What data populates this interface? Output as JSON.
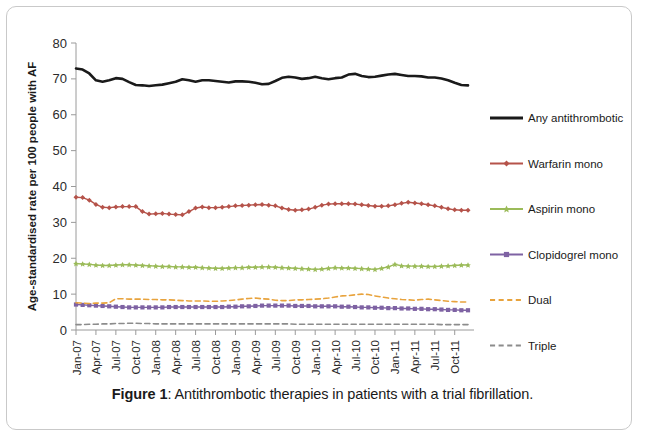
{
  "figure": {
    "caption_prefix": "Figure 1",
    "caption_text": ": Antithrombotic therapies in patients with a trial fibrillation."
  },
  "chart_data": {
    "type": "line",
    "title": "",
    "xlabel": "",
    "ylabel": "Age-standardised rate per 100 people with AF",
    "ylim": [
      0,
      80
    ],
    "ytick_labels": [
      "0",
      "10",
      "20",
      "30",
      "40",
      "50",
      "60",
      "70",
      "80"
    ],
    "yticks": [
      0,
      10,
      20,
      30,
      40,
      50,
      60,
      70,
      80
    ],
    "grid": false,
    "legend_position": "right",
    "x_start": "Jan-07",
    "x_end": "Dec-11",
    "tick_labels": [
      "Jan-07",
      "Apr-07",
      "Jul-07",
      "Oct-07",
      "Jan-08",
      "Apr-08",
      "Jul-08",
      "Oct-08",
      "Jan-09",
      "Apr-09",
      "Jul-09",
      "Oct-09",
      "Jan-10",
      "Apr-10",
      "Jul-10",
      "Oct-10",
      "Jan-11",
      "Apr-11",
      "Jul-11",
      "Oct-11"
    ],
    "x": [
      "Jan-07",
      "Feb-07",
      "Mar-07",
      "Apr-07",
      "May-07",
      "Jun-07",
      "Jul-07",
      "Aug-07",
      "Sep-07",
      "Oct-07",
      "Nov-07",
      "Dec-07",
      "Jan-08",
      "Feb-08",
      "Mar-08",
      "Apr-08",
      "May-08",
      "Jun-08",
      "Jul-08",
      "Aug-08",
      "Sep-08",
      "Oct-08",
      "Nov-08",
      "Dec-08",
      "Jan-09",
      "Feb-09",
      "Mar-09",
      "Apr-09",
      "May-09",
      "Jun-09",
      "Jul-09",
      "Aug-09",
      "Sep-09",
      "Oct-09",
      "Nov-09",
      "Dec-09",
      "Jan-10",
      "Feb-10",
      "Mar-10",
      "Apr-10",
      "May-10",
      "Jun-10",
      "Jul-10",
      "Aug-10",
      "Sep-10",
      "Oct-10",
      "Nov-10",
      "Dec-10",
      "Jan-11",
      "Feb-11",
      "Mar-11",
      "Apr-11",
      "May-11",
      "Jun-11",
      "Jul-11",
      "Aug-11",
      "Sep-11",
      "Oct-11",
      "Nov-11",
      "Dec-11"
    ],
    "series": [
      {
        "name": "Any antithrombotic",
        "color": "#1a1a1a",
        "style": "solid",
        "marker": "none",
        "width": 2.6,
        "values": [
          72.9,
          72.6,
          71.5,
          69.6,
          69.2,
          69.6,
          70.2,
          70.0,
          69.1,
          68.3,
          68.2,
          68.0,
          68.2,
          68.4,
          68.8,
          69.2,
          69.9,
          69.6,
          69.2,
          69.6,
          69.6,
          69.4,
          69.2,
          69.0,
          69.3,
          69.3,
          69.2,
          68.9,
          68.5,
          68.6,
          69.4,
          70.3,
          70.6,
          70.4,
          70.0,
          70.2,
          70.6,
          70.2,
          69.9,
          70.2,
          70.4,
          71.2,
          71.4,
          70.8,
          70.5,
          70.6,
          70.9,
          71.2,
          71.4,
          71.1,
          70.8,
          70.8,
          70.7,
          70.4,
          70.4,
          70.1,
          69.6,
          68.9,
          68.3,
          68.2
        ]
      },
      {
        "name": "Warfarin mono",
        "color": "#b5534a",
        "style": "solid",
        "marker": "diamond",
        "width": 1.4,
        "values": [
          37.0,
          36.9,
          36.2,
          35.0,
          34.2,
          34.1,
          34.3,
          34.4,
          34.4,
          34.4,
          33.0,
          32.3,
          32.4,
          32.5,
          32.3,
          32.2,
          32.1,
          33.0,
          34.0,
          34.3,
          34.1,
          34.1,
          34.2,
          34.4,
          34.6,
          34.7,
          34.8,
          34.9,
          35.0,
          34.8,
          34.6,
          34.0,
          33.6,
          33.4,
          33.5,
          33.7,
          34.2,
          34.8,
          35.1,
          35.2,
          35.2,
          35.2,
          35.1,
          34.9,
          34.7,
          34.5,
          34.5,
          34.6,
          34.9,
          35.3,
          35.6,
          35.4,
          35.2,
          34.9,
          34.6,
          34.2,
          33.8,
          33.5,
          33.4,
          33.4
        ]
      },
      {
        "name": "Aspirin mono",
        "color": "#9bbb59",
        "style": "solid",
        "marker": "star",
        "width": 1.4,
        "values": [
          18.5,
          18.4,
          18.3,
          18.1,
          18.0,
          18.0,
          18.1,
          18.2,
          18.2,
          18.1,
          18.0,
          17.9,
          17.8,
          17.7,
          17.7,
          17.6,
          17.6,
          17.5,
          17.5,
          17.4,
          17.3,
          17.2,
          17.2,
          17.3,
          17.4,
          17.4,
          17.5,
          17.5,
          17.6,
          17.6,
          17.5,
          17.4,
          17.3,
          17.2,
          17.1,
          17.0,
          16.9,
          17.0,
          17.2,
          17.4,
          17.3,
          17.3,
          17.2,
          17.1,
          17.0,
          16.9,
          17.2,
          17.6,
          18.3,
          17.9,
          17.8,
          17.8,
          17.8,
          17.7,
          17.7,
          17.8,
          17.9,
          18.0,
          18.1,
          18.1
        ]
      },
      {
        "name": "Clopidogrel mono",
        "color": "#7e62a3",
        "style": "solid",
        "marker": "square",
        "width": 1.4,
        "values": [
          7.1,
          7.0,
          6.9,
          6.8,
          6.7,
          6.6,
          6.5,
          6.4,
          6.3,
          6.3,
          6.3,
          6.3,
          6.3,
          6.3,
          6.4,
          6.4,
          6.4,
          6.4,
          6.4,
          6.4,
          6.4,
          6.4,
          6.4,
          6.5,
          6.5,
          6.6,
          6.6,
          6.7,
          6.8,
          6.8,
          6.8,
          6.8,
          6.8,
          6.7,
          6.7,
          6.7,
          6.6,
          6.6,
          6.6,
          6.6,
          6.5,
          6.5,
          6.4,
          6.3,
          6.3,
          6.2,
          6.2,
          6.1,
          6.1,
          6.0,
          6.0,
          5.9,
          5.9,
          5.8,
          5.8,
          5.7,
          5.6,
          5.6,
          5.5,
          5.5
        ]
      },
      {
        "name": "Dual",
        "color": "#e8a33d",
        "style": "dashed",
        "marker": "none",
        "width": 1.6,
        "values": [
          7.6,
          7.5,
          7.4,
          7.5,
          7.5,
          7.6,
          8.7,
          8.7,
          8.6,
          8.6,
          8.6,
          8.5,
          8.5,
          8.4,
          8.4,
          8.3,
          8.2,
          8.1,
          8.1,
          8.1,
          8.0,
          8.0,
          8.1,
          8.2,
          8.4,
          8.6,
          8.8,
          8.9,
          8.7,
          8.6,
          8.3,
          8.2,
          8.2,
          8.4,
          8.4,
          8.5,
          8.6,
          8.7,
          8.9,
          9.2,
          9.5,
          9.6,
          9.8,
          10.0,
          9.9,
          9.5,
          9.2,
          8.9,
          8.7,
          8.5,
          8.4,
          8.3,
          8.5,
          8.6,
          8.4,
          8.2,
          8.0,
          7.9,
          7.8,
          7.8
        ]
      },
      {
        "name": "Triple",
        "color": "#8c8c8c",
        "style": "dashed",
        "marker": "none",
        "width": 1.6,
        "values": [
          1.5,
          1.5,
          1.6,
          1.6,
          1.7,
          1.7,
          1.8,
          1.8,
          1.9,
          1.9,
          1.8,
          1.8,
          1.7,
          1.7,
          1.7,
          1.7,
          1.7,
          1.7,
          1.7,
          1.7,
          1.7,
          1.7,
          1.7,
          1.7,
          1.7,
          1.7,
          1.7,
          1.7,
          1.7,
          1.7,
          1.7,
          1.7,
          1.7,
          1.6,
          1.6,
          1.6,
          1.6,
          1.6,
          1.6,
          1.6,
          1.6,
          1.6,
          1.6,
          1.6,
          1.6,
          1.6,
          1.6,
          1.6,
          1.6,
          1.6,
          1.6,
          1.6,
          1.6,
          1.6,
          1.6,
          1.5,
          1.5,
          1.5,
          1.5,
          1.5
        ]
      }
    ]
  }
}
